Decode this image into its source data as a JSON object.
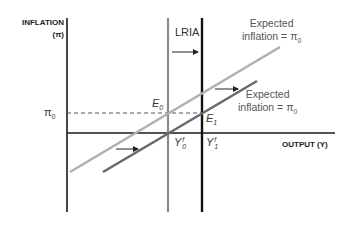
{
  "diagram": {
    "y_axis": {
      "label": "INFLATION",
      "symbol": "(π)"
    },
    "x_axis": {
      "label": "OUTPUT (Y)"
    },
    "lria_label": "LRIA",
    "pi0_label": "π",
    "pi0_sub": "0",
    "e0_label": "E",
    "e0_sub": "0",
    "e1_label": "E",
    "e1_sub": "1",
    "y0f": {
      "base": "Y",
      "sup": "f",
      "sub": "0"
    },
    "y1f": {
      "base": "Y",
      "sup": "f",
      "sub": "1"
    },
    "curve_upper": {
      "line1": "Expected",
      "line2": "inflation = π",
      "sub": "0"
    },
    "curve_lower": {
      "line1": "Expected",
      "line2": "inflation = π",
      "sub": "0"
    },
    "colors": {
      "axis": "#1a1a1a",
      "lria_initial": "#8a8a8a",
      "lria_shifted": "#111111",
      "curve_upper": "#b0b0b0",
      "curve_lower": "#6a6a6a",
      "dashed": "#555555"
    }
  }
}
